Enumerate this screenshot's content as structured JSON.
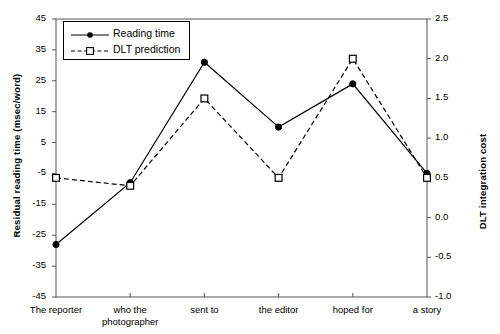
{
  "chart_data": {
    "type": "line",
    "title": "",
    "xlabel": "",
    "categories": [
      "The reporter",
      "who the\nphotographer",
      "sent to",
      "the editor",
      "hoped for",
      "a story"
    ],
    "category_lines": [
      [
        "The reporter"
      ],
      [
        "who the",
        "photographer"
      ],
      [
        "sent to"
      ],
      [
        "the editor"
      ],
      [
        "hoped for"
      ],
      [
        "a story"
      ]
    ],
    "series": [
      {
        "name": "Reading time",
        "axis": "left",
        "marker": "filled-circle",
        "linestyle": "solid",
        "color": "#000000",
        "values": [
          -28,
          -8,
          31,
          10,
          24,
          -5
        ]
      },
      {
        "name": "DLT prediction",
        "axis": "right",
        "marker": "open-square",
        "linestyle": "dashed",
        "color": "#000000",
        "values": [
          0.5,
          0.4,
          1.5,
          0.5,
          2.0,
          0.5
        ]
      }
    ],
    "left_axis": {
      "label": "Residual reading time (msec/word)",
      "ylim": [
        -45,
        45
      ],
      "tick_step": 10,
      "ticks": [
        45,
        35,
        25,
        15,
        5,
        -5,
        -15,
        -25,
        -35,
        -45
      ],
      "tick_labels": [
        "45",
        "35",
        "25",
        "15",
        "5",
        "-5",
        "-15",
        "-25",
        "-35",
        "-45"
      ]
    },
    "right_axis": {
      "label": "DLT integration cost",
      "ylim": [
        -1.0,
        2.5
      ],
      "tick_step": 0.5,
      "ticks": [
        2.5,
        2.0,
        1.5,
        1.0,
        0.5,
        0.0,
        -0.5,
        -1.0
      ],
      "tick_labels": [
        "2.5",
        "2.0",
        "1.5",
        "1.0",
        "0.5",
        "0.0",
        "-0.5",
        "-1.0"
      ]
    },
    "legend": {
      "position": "top-left-inside",
      "entries": [
        {
          "label": "Reading time",
          "marker": "filled-circle",
          "linestyle": "solid"
        },
        {
          "label": "DLT prediction",
          "marker": "open-square",
          "linestyle": "dashed"
        }
      ]
    },
    "grid": false,
    "frame": true
  }
}
